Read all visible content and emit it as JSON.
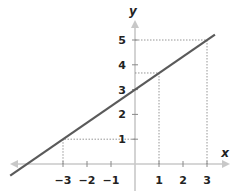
{
  "chart_data": {
    "type": "line",
    "title": "",
    "xlabel": "x",
    "ylabel": "y",
    "equation": "y = (2/3)x + 3",
    "series": [
      {
        "name": "line",
        "x": [
          -5.2,
          3.33
        ],
        "y": [
          -0.47,
          5.22
        ]
      }
    ],
    "highlighted_points": [
      {
        "x": -3,
        "y": 1
      },
      {
        "x": 1,
        "y": 3.67
      },
      {
        "x": 3,
        "y": 5
      }
    ],
    "x_ticks": [
      -3,
      -2,
      -1,
      1,
      2,
      3
    ],
    "x_tick_labels": [
      "−3",
      "−2",
      "−1",
      "1",
      "2",
      "3"
    ],
    "y_ticks": [
      1,
      2,
      3,
      4,
      5
    ],
    "y_tick_labels": [
      "1",
      "2",
      "3",
      "4",
      "5"
    ],
    "xlim": [
      -5.2,
      4
    ],
    "ylim": [
      -1,
      5.8
    ],
    "grid": false,
    "legend": null
  },
  "colors": {
    "line": "#5a5a5a",
    "axis": "#c8c8c8",
    "dotted": "#8a8a8a",
    "text": "#222222"
  }
}
